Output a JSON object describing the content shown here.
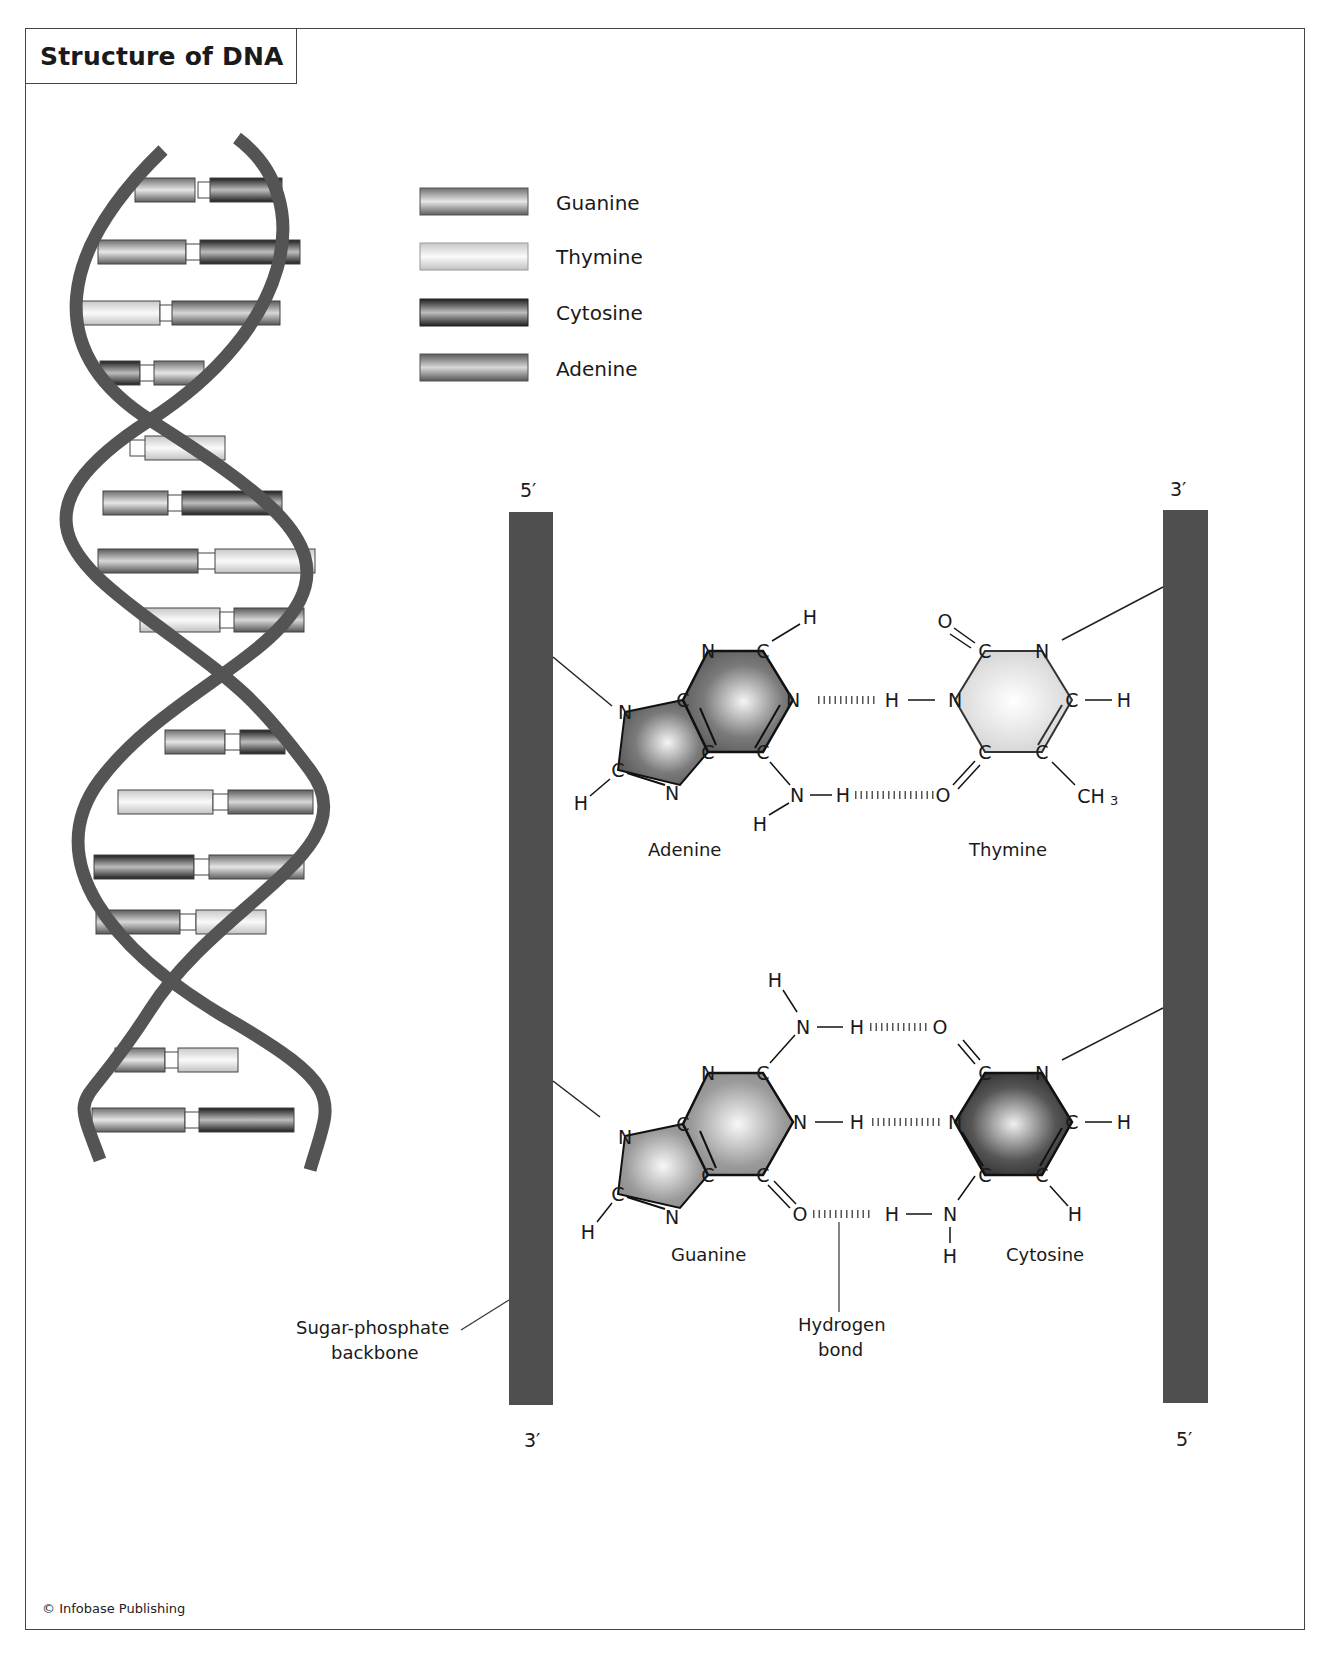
{
  "title": "Structure of DNA",
  "legend": {
    "items": [
      {
        "label": "Guanine",
        "swatch": "medium-gray-cylinder",
        "color": "#8c8c8c"
      },
      {
        "label": "Thymine",
        "swatch": "light-gray-cylinder",
        "color": "#dcdcdc"
      },
      {
        "label": "Cytosine",
        "swatch": "dark-gray-cylinder",
        "color": "#3a3a3a"
      },
      {
        "label": "Adenine",
        "swatch": "gray-cylinder",
        "color": "#7a7a7a"
      }
    ]
  },
  "helix": {
    "backbone_color": "#555555",
    "base_pairs_top_to_bottom": [
      [
        "Guanine",
        "Cytosine"
      ],
      [
        "Guanine",
        "Cytosine"
      ],
      [
        "Thymine",
        "Adenine"
      ],
      [
        "Cytosine",
        "Guanine"
      ],
      [
        "Adenine",
        "Thymine"
      ],
      [
        "Guanine",
        "Cytosine"
      ],
      [
        "Adenine",
        "Thymine"
      ],
      [
        "Thymine",
        "Adenine"
      ],
      [
        "Guanine",
        "Cytosine"
      ],
      [
        "Thymine",
        "Adenine"
      ],
      [
        "Cytosine",
        "Guanine"
      ],
      [
        "Adenine",
        "Thymine"
      ],
      [
        "Guanine",
        "Thymine"
      ],
      [
        "Guanine",
        "Cytosine"
      ]
    ]
  },
  "strands": {
    "left": {
      "top_label": "5′",
      "bottom_label": "3′"
    },
    "right": {
      "top_label": "3′",
      "bottom_label": "5′"
    },
    "color": "#4d4d4d"
  },
  "pairs": {
    "at": {
      "left_name": "Adenine",
      "right_name": "Thymine",
      "adenine_atoms": [
        "N",
        "C",
        "H",
        "N",
        "C",
        "C",
        "C",
        "N",
        "C",
        "N",
        "H",
        "N",
        "H",
        "H"
      ],
      "thymine_atoms": [
        "O",
        "C",
        "N",
        "N",
        "C",
        "H",
        "C",
        "C",
        "O",
        "CH3"
      ],
      "hbond_atoms": [
        "H",
        "H"
      ]
    },
    "gc": {
      "left_name": "Guanine",
      "right_name": "Cytosine",
      "guanine_atoms": [
        "H",
        "N",
        "H",
        "N",
        "C",
        "N",
        "C",
        "C",
        "C",
        "N",
        "C",
        "N",
        "H",
        "O"
      ],
      "cytosine_atoms": [
        "O",
        "C",
        "N",
        "N",
        "C",
        "H",
        "C",
        "C",
        "H",
        "N",
        "H",
        "H"
      ]
    }
  },
  "annotations": {
    "backbone": "Sugar-phosphate",
    "backbone_line2": "backbone",
    "hbond": "Hydrogen",
    "hbond_line2": "bond"
  },
  "atom_labels": {
    "N": "N",
    "C": "C",
    "H": "H",
    "O": "O",
    "CH": "CH",
    "sub3": "3"
  },
  "credit": "© Infobase Publishing"
}
